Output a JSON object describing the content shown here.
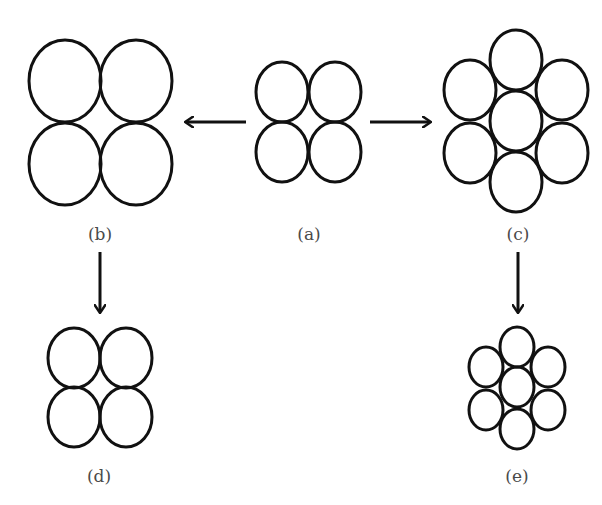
{
  "diagram": {
    "stroke_color": "#111111",
    "background": "#ffffff",
    "panels": {
      "a": {
        "label": "(a)",
        "description": "4 circles in square packing (original)"
      },
      "b": {
        "label": "(b)",
        "description": "4 enlarged circles in square packing"
      },
      "c": {
        "label": "(c)",
        "description": "7 circles in hexagonal packing"
      },
      "d": {
        "label": "(d)",
        "description": "4 circles in square packing, reduced"
      },
      "e": {
        "label": "(e)",
        "description": "7 circles in hexagonal packing, reduced"
      }
    },
    "arrows": [
      {
        "from": "a",
        "to": "b",
        "direction": "left"
      },
      {
        "from": "a",
        "to": "c",
        "direction": "right"
      },
      {
        "from": "b",
        "to": "d",
        "direction": "down"
      },
      {
        "from": "c",
        "to": "e",
        "direction": "down"
      }
    ]
  }
}
